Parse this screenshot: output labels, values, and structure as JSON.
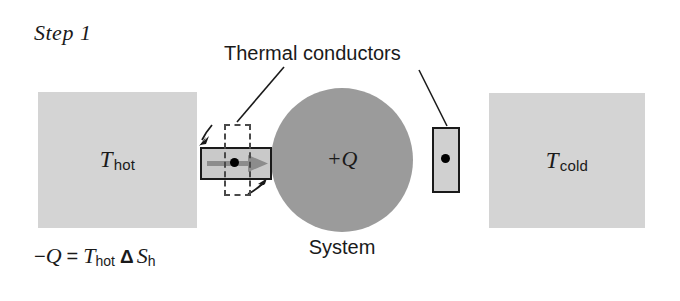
{
  "figure": {
    "step_label": "Step 1",
    "conductors_label": "Thermal conductors",
    "system_caption": "System",
    "system_charge": "+Q",
    "equation": {
      "lhs_sign": "−",
      "lhs_symbol": "Q",
      "equals": "=",
      "rhs_symbol": "T",
      "rhs_subscript": "hot",
      "delta": "Δ",
      "entropy_symbol": "S",
      "entropy_subscript": "h",
      "full_text": "−Q = T_hot Δ S_h"
    },
    "reservoirs": [
      {
        "name": "hot-reservoir",
        "symbol": "T",
        "subscript": "hot",
        "fill": "#d4d4d4"
      },
      {
        "name": "cold-reservoir",
        "symbol": "T",
        "subscript": "cold",
        "fill": "#d4d4d4"
      }
    ],
    "system": {
      "fill": "#9b9b9b",
      "charge_label": "+Q"
    },
    "conductors": [
      {
        "name": "left-conductor",
        "orientation": "horizontal",
        "fill": "#c9c9c9",
        "stroke": "#1a1a1a",
        "has_arrow": true,
        "arrow_direction": "right",
        "arrow_color": "#8c8c8c",
        "has_dot": true,
        "dashed_overlay": true,
        "dashed_orientation": "vertical",
        "rotation_arrows": 2
      },
      {
        "name": "right-conductor",
        "orientation": "vertical",
        "fill": "#d0d0d0",
        "stroke": "#1a1a1a",
        "has_arrow": false,
        "has_dot": true,
        "dashed_overlay": false,
        "rotation_arrows": 0
      }
    ],
    "colors": {
      "background": "#ffffff",
      "reservoir_gray": "#d4d4d4",
      "system_gray": "#9b9b9b",
      "conductor_gray": "#c9c9c9",
      "arrow_gray": "#8c8c8c",
      "ink": "#1a1a1a"
    }
  }
}
